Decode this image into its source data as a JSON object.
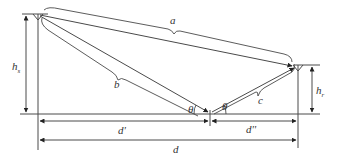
{
  "diagram": {
    "type": "two-ray ground reflection geometry",
    "labels": {
      "a": "a",
      "b": "b",
      "c": "c",
      "hs_main": "h",
      "hs_sub": "s",
      "hr_main": "h",
      "hr_sub": "r",
      "theta_left": "θ",
      "theta_right": "θ",
      "d_prime": "d'",
      "d_double_prime": "d''",
      "d": "d"
    },
    "colors": {
      "stroke": "#4a4a4a",
      "text": "#333333",
      "background": "#ffffff"
    }
  }
}
